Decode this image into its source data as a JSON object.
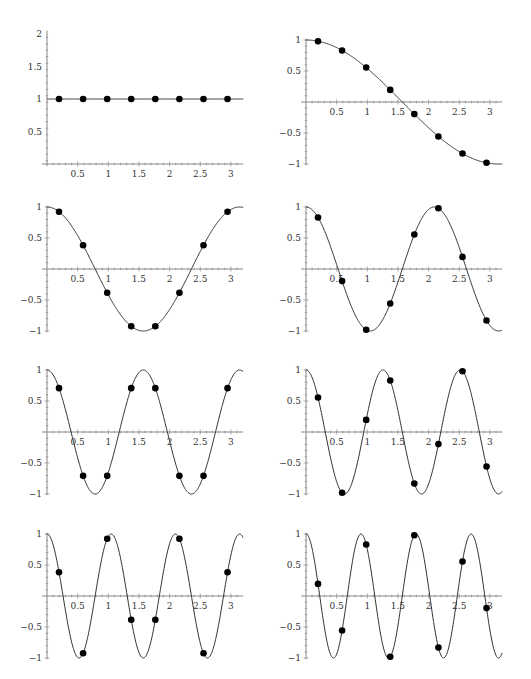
{
  "chart_data": [
    {
      "type": "line",
      "title": "",
      "function": "cos(0x)",
      "k": 0,
      "xlabel": "",
      "ylabel": "",
      "xlim": [
        0,
        3.2
      ],
      "ylim": [
        0,
        2.1
      ],
      "x_ticks": [
        "0.5",
        "1",
        "1.5",
        "2",
        "2.5",
        "3"
      ],
      "y_ticks": [
        "0.5",
        "1",
        "1.5",
        "2"
      ],
      "points_x": [
        0.196,
        0.589,
        0.982,
        1.374,
        1.767,
        2.16,
        2.553,
        2.945
      ],
      "points_y": [
        1,
        1,
        1,
        1,
        1,
        1,
        1,
        1
      ]
    },
    {
      "type": "line",
      "title": "",
      "function": "cos(1x)",
      "k": 1,
      "xlim": [
        0,
        3.2
      ],
      "ylim": [
        -1,
        1
      ],
      "x_ticks": [
        "0.5",
        "1",
        "1.5",
        "2",
        "2.5",
        "3"
      ],
      "y_ticks": [
        "-1",
        "-0.5",
        "0.5",
        "1"
      ],
      "points_x": [
        0.196,
        0.589,
        0.982,
        1.374,
        1.767,
        2.16,
        2.553,
        2.945
      ],
      "points_y": [
        0.981,
        0.831,
        0.556,
        0.195,
        -0.195,
        -0.556,
        -0.831,
        -0.981
      ]
    },
    {
      "type": "line",
      "title": "",
      "function": "cos(2x)",
      "k": 2,
      "xlim": [
        0,
        3.2
      ],
      "ylim": [
        -1,
        1
      ],
      "x_ticks": [
        "0.5",
        "1",
        "1.5",
        "2",
        "2.5",
        "3"
      ],
      "y_ticks": [
        "-1",
        "-0.5",
        "0.5",
        "1"
      ],
      "points_x": [
        0.196,
        0.589,
        0.982,
        1.374,
        1.767,
        2.16,
        2.553,
        2.945
      ],
      "points_y": [
        0.924,
        0.383,
        -0.383,
        -0.924,
        -0.924,
        -0.383,
        0.383,
        0.924
      ]
    },
    {
      "type": "line",
      "title": "",
      "function": "cos(3x)",
      "k": 3,
      "xlim": [
        0,
        3.2
      ],
      "ylim": [
        -1,
        1
      ],
      "x_ticks": [
        "0.5",
        "1",
        "1.5",
        "2",
        "2.5",
        "3"
      ],
      "y_ticks": [
        "-1",
        "-0.5",
        "0.5",
        "1"
      ],
      "points_x": [
        0.196,
        0.589,
        0.982,
        1.374,
        1.767,
        2.16,
        2.553,
        2.945
      ],
      "points_y": [
        0.831,
        -0.195,
        -0.981,
        -0.556,
        0.556,
        0.981,
        0.195,
        -0.831
      ]
    },
    {
      "type": "line",
      "title": "",
      "function": "cos(4x)",
      "k": 4,
      "xlim": [
        0,
        3.2
      ],
      "ylim": [
        -1,
        1
      ],
      "x_ticks": [
        "0.5",
        "1",
        "1.5",
        "2",
        "2.5",
        "3"
      ],
      "y_ticks": [
        "-1",
        "-0.5",
        "0.5",
        "1"
      ],
      "points_x": [
        0.196,
        0.589,
        0.982,
        1.374,
        1.767,
        2.16,
        2.553,
        2.945
      ],
      "points_y": [
        0.707,
        -0.707,
        -0.707,
        0.707,
        0.707,
        -0.707,
        -0.707,
        0.707
      ]
    },
    {
      "type": "line",
      "title": "",
      "function": "cos(5x)",
      "k": 5,
      "xlim": [
        0,
        3.2
      ],
      "ylim": [
        -1,
        1
      ],
      "x_ticks": [
        "0.5",
        "1",
        "1.5",
        "2",
        "2.5",
        "3"
      ],
      "y_ticks": [
        "-1",
        "-0.5",
        "0.5",
        "1"
      ],
      "points_x": [
        0.196,
        0.589,
        0.982,
        1.374,
        1.767,
        2.16,
        2.553,
        2.945
      ],
      "points_y": [
        0.556,
        -0.981,
        0.195,
        0.831,
        -0.831,
        -0.195,
        0.981,
        -0.556
      ]
    },
    {
      "type": "line",
      "title": "",
      "function": "cos(6x)",
      "k": 6,
      "xlim": [
        0,
        3.2
      ],
      "ylim": [
        -1,
        1
      ],
      "x_ticks": [
        "0.5",
        "1",
        "1.5",
        "2",
        "2.5",
        "3"
      ],
      "y_ticks": [
        "-1",
        "-0.5",
        "0.5",
        "1"
      ],
      "points_x": [
        0.196,
        0.589,
        0.982,
        1.374,
        1.767,
        2.16,
        2.553,
        2.945
      ],
      "points_y": [
        0.383,
        -0.924,
        0.924,
        -0.383,
        -0.383,
        0.924,
        -0.924,
        0.383
      ]
    },
    {
      "type": "line",
      "title": "",
      "function": "cos(7x)",
      "k": 7,
      "xlim": [
        0,
        3.2
      ],
      "ylim": [
        -1,
        1
      ],
      "x_ticks": [
        "0.5",
        "1",
        "1.5",
        "2",
        "2.5",
        "3"
      ],
      "y_ticks": [
        "-1",
        "-0.5",
        "0.5",
        "1"
      ],
      "points_x": [
        0.196,
        0.589,
        0.982,
        1.374,
        1.767,
        2.16,
        2.553,
        2.945
      ],
      "points_y": [
        0.195,
        -0.556,
        0.831,
        -0.981,
        0.981,
        -0.831,
        0.556,
        -0.195
      ]
    }
  ],
  "labels": {
    "x_ticks": [
      "0.5",
      "1",
      "1.5",
      "2",
      "2.5",
      "3"
    ],
    "y_ticks_first": [
      "0.5",
      "1",
      "1.5",
      "2"
    ],
    "y_ticks_signed": [
      "1",
      "0.5",
      "−0.5",
      "−1"
    ]
  },
  "colors": {
    "curve": "#333333",
    "axis": "#888888",
    "point": "#000000"
  }
}
